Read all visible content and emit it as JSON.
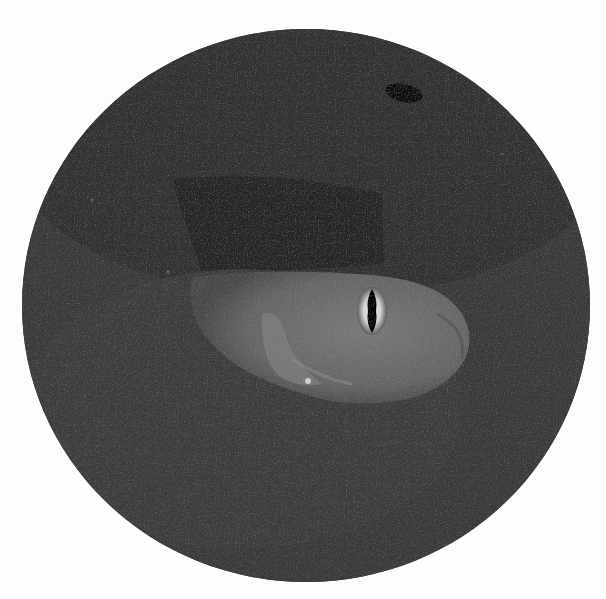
{
  "image": {
    "description": "Grayscale circular photograph of a fish head emerging from sandy substrate",
    "subject": "fish",
    "background_color": "#fdfdfd",
    "circle_color": "#3a3a3a",
    "colors": {
      "sand_dark": "#2e2e2e",
      "sand": "#3c3c3c",
      "shadow": "#262626",
      "fish_body": "#6a6a6a",
      "fish_highlight": "#7e7e7e",
      "eye_ring": "#bdbdbd",
      "pupil": "#050505"
    }
  }
}
